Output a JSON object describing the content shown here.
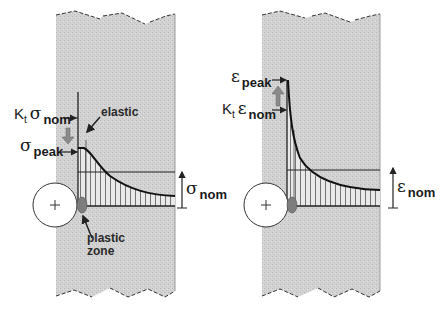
{
  "left_panel": {
    "title_hint": "stress distribution",
    "labels": {
      "kt": "K",
      "kt_sub": "t",
      "sigma_nom_symbol": "σ",
      "sigma_nom_sub": "nom",
      "sigma_peak_symbol": "σ",
      "sigma_peak_sub": "peak",
      "elastic": "elastic",
      "plastic_zone_line1": "plastic",
      "plastic_zone_line2": "zone",
      "nominal_symbol": "σ",
      "nominal_sub": "nom"
    }
  },
  "right_panel": {
    "title_hint": "strain distribution",
    "labels": {
      "eps_peak_symbol": "ε",
      "eps_peak_sub": "peak",
      "kt": "K",
      "kt_sub": "t",
      "eps_nom_symbol": "ε",
      "eps_nom_sub": "nom",
      "nominal_symbol": "ε",
      "nominal_sub": "nom"
    }
  },
  "colors": {
    "plate_fill": "#cfcfcf",
    "line": "#222222",
    "arrow_fill": "#8a8a8a",
    "plastic_zone_fill": "#7d7d7d",
    "hole_fill": "#ffffff"
  }
}
